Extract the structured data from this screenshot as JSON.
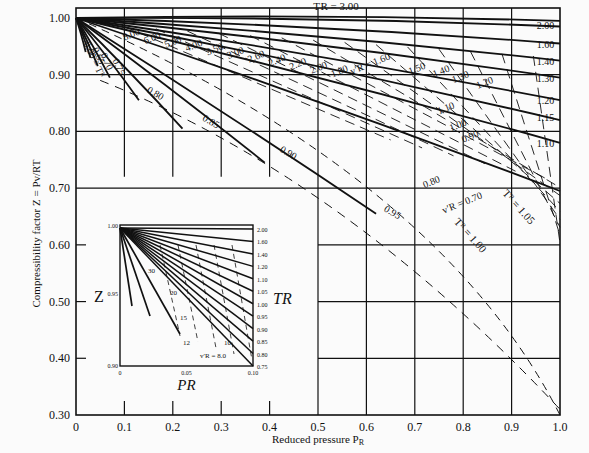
{
  "chart_data": {
    "type": "line",
    "xlabel": "Reduced pressure P_R",
    "ylabel": "Compressibility factor Z = Pv/RT",
    "xlim": [
      0,
      1.0
    ],
    "ylim": [
      0.3,
      1.0
    ],
    "grid": true,
    "x_ticks": [
      "0",
      "0.1",
      "0.2",
      "0.3",
      "0.4",
      "0.5",
      "0.6",
      "0.7",
      "0.8",
      "0.9",
      "1.0"
    ],
    "y_ticks": [
      "0.30",
      "0.40",
      "0.50",
      "0.60",
      "0.70",
      "0.80",
      "0.90",
      "1.00"
    ],
    "isotherms_TR": [
      {
        "label": "3.00",
        "z_at_PR1": 0.995
      },
      {
        "label": "2.00",
        "z_at_PR1": 0.985
      },
      {
        "label": "1.60",
        "z_at_PR1": 0.955
      },
      {
        "label": "1.40",
        "z_at_PR1": 0.925
      },
      {
        "label": "1.30",
        "z_at_PR1": 0.895
      },
      {
        "label": "1.20",
        "z_at_PR1": 0.855
      },
      {
        "label": "1.15",
        "z_at_PR1": 0.82
      },
      {
        "label": "1.10",
        "z_at_PR1": 0.78
      },
      {
        "label": "1.05",
        "z_at_PR1": 0.695
      },
      {
        "label": "1.00",
        "z_at_PR1": 0.3
      },
      {
        "label": "0.95",
        "end_PR": 0.62,
        "z_end": 0.655
      },
      {
        "label": "0.90",
        "end_PR": 0.39,
        "z_end": 0.745
      },
      {
        "label": "0.85",
        "end_PR": 0.22,
        "z_end": 0.805
      },
      {
        "label": "0.80",
        "end_PR": 0.13,
        "z_end": 0.855
      },
      {
        "label": "0.75",
        "end_PR": 0.07,
        "z_end": 0.895
      },
      {
        "label": "0.70",
        "end_PR": 0.045,
        "z_end": 0.915
      },
      {
        "label": "0.65",
        "end_PR": 0.03,
        "z_end": 0.93
      },
      {
        "label": "0.60",
        "end_PR": 0.02,
        "z_end": 0.94
      }
    ],
    "ideal_reduced_volume_vR": [
      "8.00",
      "6.00",
      "5.00",
      "4.00",
      "3.50",
      "3.00",
      "2.60",
      "2.40",
      "2.20",
      "2.00",
      "1.80",
      "1.60",
      "1.50",
      "1.40",
      "1.30",
      "1.20",
      "1.10",
      "1.00",
      "0.90",
      "0.80",
      "0.70"
    ],
    "annotations": [
      "T_R = 3.00",
      "v'_R = 1.60",
      "v'_R = 0.70",
      "T_R = 1.05",
      "T_R = 1.00",
      "0.60 = T_R"
    ],
    "inset": {
      "xlabel": "P_R",
      "ylabel": "Z",
      "right_label": "T_R",
      "x_ticks": [
        "0",
        "0.05",
        "0.10"
      ],
      "y_ticks": [
        "0.90",
        "0.95",
        "1.00"
      ],
      "TR_right_ticks": [
        "2.00",
        "1.60",
        "1.40",
        "1.20",
        "1.10",
        "1.05",
        "1.00",
        "0.95",
        "0.90",
        "0.85",
        "0.80",
        "0.75"
      ],
      "vR_labels": [
        "30",
        "20",
        "15",
        "12",
        "10",
        "v'_R = 8.0"
      ],
      "TR_labels": [
        "0.60 = T_R",
        "0.65",
        "0.70"
      ]
    }
  },
  "labels": {
    "y_axis": "Compressibility factor Z = ",
    "y_frac_num": "Pv",
    "y_frac_den": "RT",
    "x_axis": "Reduced pressure P",
    "x_axis_sub": "R"
  }
}
